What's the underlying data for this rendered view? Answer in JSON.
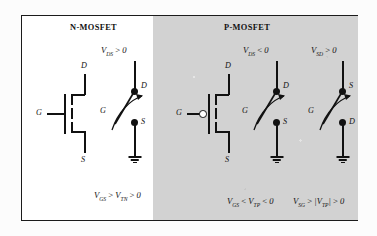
{
  "figure": {
    "panels": [
      {
        "id": "n-mosfet",
        "title": "N-MOSFET",
        "background": "#ffffff",
        "symbol": {
          "type": "nmos-symbol",
          "gate_label": "G",
          "drain_label": "D",
          "source_label": "S",
          "has_gate_bubble": false
        },
        "circuits": [
          {
            "id": "nmos-switch",
            "supply_label": "V_DS > 0",
            "supply_label_parts": {
              "v": "V",
              "sub": "DS",
              "rel": ">",
              "val": "0"
            },
            "top_terminal": "D",
            "bottom_terminal": "S",
            "gate_label": "G",
            "grounded": true,
            "condition": "V_GS > V_TN > 0",
            "condition_parts": [
              {
                "v": "V",
                "sub": "GS"
              },
              {
                "rel": ">"
              },
              {
                "v": "V",
                "sub": "TN"
              },
              {
                "rel": ">"
              },
              {
                "val": "0"
              }
            ]
          }
        ]
      },
      {
        "id": "p-mosfet",
        "title": "P-MOSFET",
        "background": "#d2d2d2",
        "symbol": {
          "type": "pmos-symbol",
          "gate_label": "G",
          "drain_label": "D",
          "source_label": "S",
          "has_gate_bubble": true
        },
        "circuits": [
          {
            "id": "pmos-switch-vds",
            "supply_label": "V_DS < 0",
            "supply_label_parts": {
              "v": "V",
              "sub": "DS",
              "rel": "<",
              "val": "0"
            },
            "top_terminal": "D",
            "bottom_terminal": "S",
            "gate_label": "G",
            "grounded": true,
            "condition": "V_GS < V_TP < 0",
            "condition_parts": [
              {
                "v": "V",
                "sub": "GS"
              },
              {
                "rel": "<"
              },
              {
                "v": "V",
                "sub": "TP"
              },
              {
                "rel": "<"
              },
              {
                "val": "0"
              }
            ]
          },
          {
            "id": "pmos-switch-vsd",
            "supply_label": "V_SD > 0",
            "supply_label_parts": {
              "v": "V",
              "sub": "SD",
              "rel": ">",
              "val": "0"
            },
            "top_terminal": "S",
            "bottom_terminal": "D",
            "gate_label": "G",
            "grounded": true,
            "condition": "V_SG > |V_TP| > 0",
            "condition_parts": [
              {
                "v": "V",
                "sub": "SG"
              },
              {
                "rel": ">"
              },
              {
                "v": "|V",
                "sub": "TP",
                "close": "|"
              },
              {
                "rel": ">"
              },
              {
                "val": "0"
              }
            ]
          }
        ]
      }
    ],
    "colors": {
      "ink": "#111111",
      "panel_gray": "#d2d2d2",
      "paper": "#ffffff"
    }
  }
}
